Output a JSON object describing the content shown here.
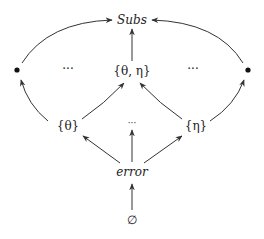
{
  "diagram": {
    "type": "lattice / Hasse diagram",
    "nodes": {
      "top": {
        "label": "Subs",
        "italic": true
      },
      "left_dot": {
        "label": "•"
      },
      "right_dot": {
        "label": "•"
      },
      "left_ellipsis": {
        "label": "···"
      },
      "theta_eta": {
        "label": "{θ, η}"
      },
      "right_ellipsis": {
        "label": "···"
      },
      "theta": {
        "label": "{θ}"
      },
      "mid_ellipsis": {
        "label": "···"
      },
      "eta": {
        "label": "{η}"
      },
      "error": {
        "label": "error",
        "italic": true
      },
      "empty": {
        "label": "∅"
      }
    },
    "edges": [
      {
        "from": "empty",
        "to": "error"
      },
      {
        "from": "error",
        "to": "theta"
      },
      {
        "from": "error",
        "to": "mid_ellipsis"
      },
      {
        "from": "error",
        "to": "eta"
      },
      {
        "from": "theta",
        "to": "left_dot"
      },
      {
        "from": "theta",
        "to": "theta_eta"
      },
      {
        "from": "eta",
        "to": "theta_eta"
      },
      {
        "from": "eta",
        "to": "right_dot"
      },
      {
        "from": "left_dot",
        "to": "top"
      },
      {
        "from": "theta_eta",
        "to": "top"
      },
      {
        "from": "right_dot",
        "to": "top"
      }
    ],
    "colors": {
      "ink": "#222222",
      "background": "#ffffff"
    }
  }
}
